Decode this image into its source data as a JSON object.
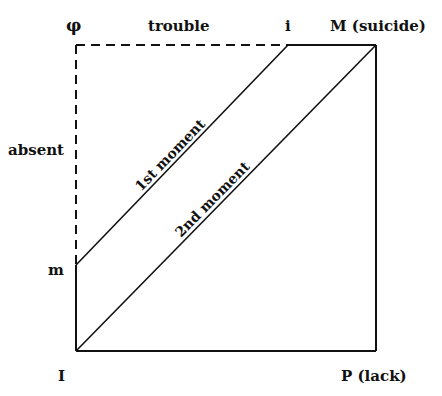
{
  "diagram": {
    "corners": {
      "top_left": "φ",
      "top_right": "M (suicide)",
      "bottom_left": "I",
      "bottom_right": "P (lack)"
    },
    "top_edge": {
      "label": "trouble",
      "point_label": "i"
    },
    "left_edge": {
      "label": "absent",
      "point_label": "m"
    },
    "lines": [
      {
        "label": "1st moment",
        "from": "m",
        "to": "i"
      },
      {
        "label": "2nd moment",
        "from": "I",
        "to": "M (suicide)"
      }
    ],
    "colors": {
      "stroke": "#111111",
      "background": "#ffffff"
    }
  }
}
